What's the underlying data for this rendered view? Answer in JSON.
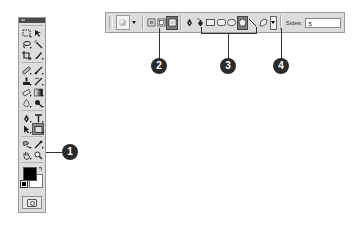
{
  "toolbox": {
    "title": "",
    "tools": [
      [
        "marquee-tool",
        "move-tool"
      ],
      [
        "lasso-tool",
        "magic-wand-tool"
      ],
      [
        "crop-tool",
        "slice-tool"
      ],
      [
        "healing-brush-tool",
        "brush-tool"
      ],
      [
        "clone-stamp-tool",
        "history-brush-tool"
      ],
      [
        "eraser-tool",
        "gradient-tool"
      ],
      [
        "blur-tool",
        "dodge-tool"
      ],
      [
        "pen-tool",
        "type-tool"
      ],
      [
        "path-selection-tool",
        "shape-tool"
      ],
      [
        "notes-tool",
        "eyedropper-tool"
      ],
      [
        "hand-tool",
        "zoom-tool"
      ]
    ],
    "active_tool": "shape-tool",
    "foreground_color": "#000000",
    "background_color": "#ffffff",
    "swap_icon": "↰",
    "quick_mask_mode": "standard-mode"
  },
  "options_bar": {
    "preset_picker": "tool-preset-picker",
    "mode_buttons": [
      "shape-layers",
      "paths",
      "fill-pixels"
    ],
    "active_mode": "fill-pixels",
    "pen_buttons": [
      "pen",
      "freeform-pen"
    ],
    "shape_buttons": [
      "rectangle",
      "rounded-rectangle",
      "ellipse",
      "polygon"
    ],
    "active_shape": "polygon",
    "line_button": "line",
    "custom_shape_button": "custom-shape",
    "sides_label": "Sides:",
    "sides_value": "5"
  },
  "callouts": [
    {
      "number": "1",
      "target": "shape-tool"
    },
    {
      "number": "2",
      "target": "fill-pixels-button"
    },
    {
      "number": "3",
      "target": "shape-buttons"
    },
    {
      "number": "4",
      "target": "geometry-options-dropdown"
    }
  ]
}
